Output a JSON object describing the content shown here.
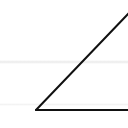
{
  "diagram": {
    "shape": "triangle",
    "stroke_color": "#111111",
    "background_color": "#ffffff",
    "stroke_width": 2,
    "vertices": [
      [
        36,
        110
      ],
      [
        128,
        14
      ],
      [
        128,
        110
      ]
    ]
  }
}
